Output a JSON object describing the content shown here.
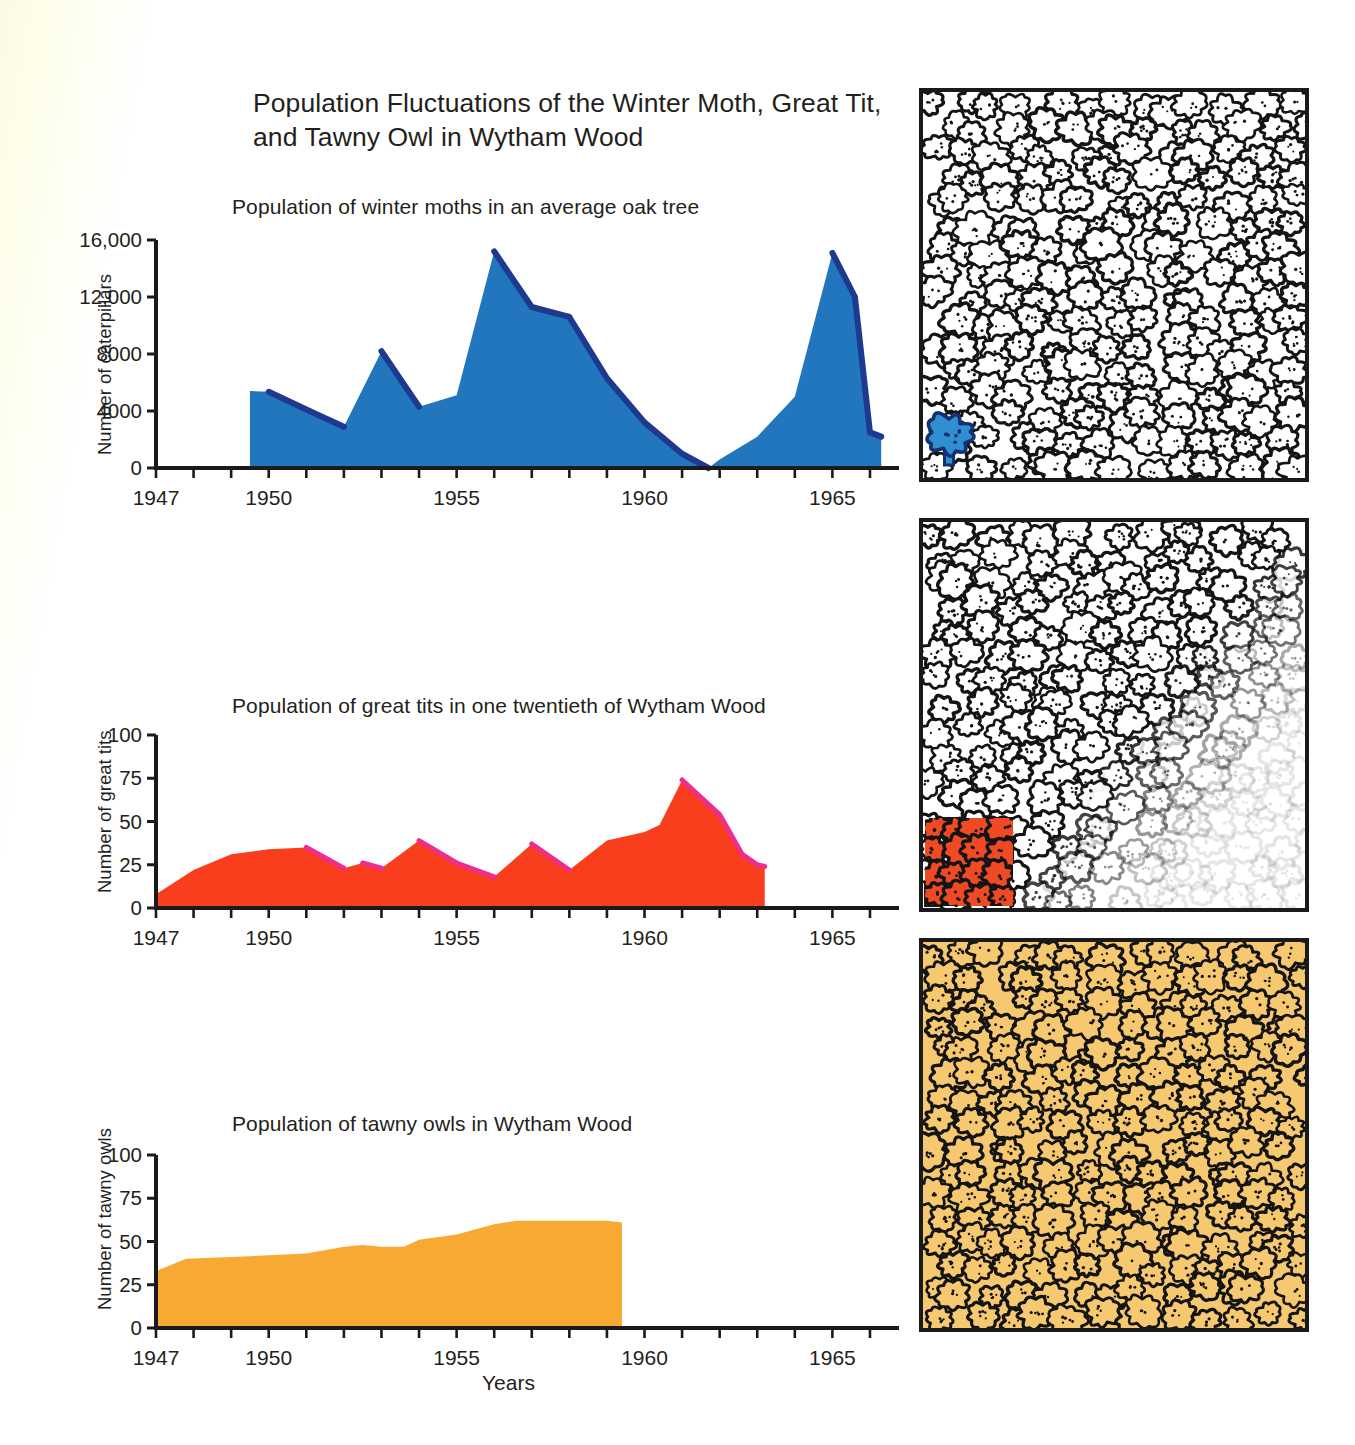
{
  "figure": {
    "title": "Population Fluctuations of the Winter Moth, Great Tit,\nand Tawny Owl in Wytham Wood",
    "title_line1": "Population Fluctuations of the Winter Moth, Great Tit,",
    "title_line2": "and Tawny Owl in Wytham Wood",
    "x_axis_label": "Years",
    "background_color": "#ffffff"
  },
  "colors": {
    "moth_fill": "#2176bd",
    "moth_edge": "#1d3a8f",
    "tit_fill": "#f93e1d",
    "tit_edge": "#ee2d8e",
    "owl_fill": "#f7a933",
    "panel_tint_owl": "#f6c870",
    "panel_tint_tit": "#f04a25",
    "panel_tree_blue": "#2f8fd0",
    "axis": "#1a1a1a",
    "text": "#231f20"
  },
  "panels": [
    {
      "name": "forest-single-oak",
      "description": "Forest of outlined oak trees with one highlighted blue tree in the lower-left corner",
      "highlight": "single-blue-tree"
    },
    {
      "name": "forest-one-twentieth",
      "description": "Forest of outlined oak trees with a red square covering one twentieth of the wood at the lower left",
      "highlight": "red-square-region"
    },
    {
      "name": "forest-whole-wood",
      "description": "Entire forest tinted orange representing the whole of Wytham Wood",
      "highlight": "whole-wood-orange"
    }
  ],
  "chart_data": [
    {
      "type": "area",
      "name": "winter-moths",
      "title": "Population of winter moths in an average oak tree",
      "xlabel": "",
      "ylabel": "Number of caterpillars",
      "xlim": [
        1947,
        1966.4
      ],
      "ylim": [
        0,
        16000
      ],
      "ytick_labels": [
        "0",
        "4000",
        "8000",
        "12,000",
        "16,000"
      ],
      "yticks": [
        0,
        4000,
        8000,
        12000,
        16000
      ],
      "xtick_labels": [
        "1947",
        "1950",
        "1955",
        "1960",
        "1965"
      ],
      "xticks_labeled": [
        1947,
        1950,
        1955,
        1960,
        1965
      ],
      "xticks_minor_step": 1,
      "grid": false,
      "legend": "none",
      "fill_color": "#2176bd",
      "edge_color": "#1d3a8f",
      "x": [
        1949.5,
        1950,
        1951,
        1952,
        1953,
        1954,
        1955,
        1956,
        1957,
        1958,
        1959,
        1960,
        1961,
        1961.7,
        1962,
        1963,
        1964,
        1965,
        1965.6,
        1966,
        1966.3
      ],
      "values": [
        5400,
        5350,
        4100,
        2900,
        8200,
        4300,
        5100,
        15200,
        11300,
        10600,
        6300,
        3200,
        1000,
        0,
        600,
        2200,
        5000,
        15100,
        12000,
        2500,
        2200
      ]
    },
    {
      "type": "area",
      "name": "great-tits",
      "title": "Population of great tits in one twentieth of Wytham Wood",
      "xlabel": "",
      "ylabel": "Number of great tits",
      "xlim": [
        1947,
        1966.4
      ],
      "ylim": [
        0,
        100
      ],
      "ytick_labels": [
        "0",
        "25",
        "50",
        "75",
        "100"
      ],
      "yticks": [
        0,
        25,
        50,
        75,
        100
      ],
      "xtick_labels": [
        "1947",
        "1950",
        "1955",
        "1960",
        "1965"
      ],
      "xticks_labeled": [
        1947,
        1950,
        1955,
        1960,
        1965
      ],
      "xticks_minor_step": 1,
      "grid": false,
      "legend": "none",
      "fill_color": "#f93e1d",
      "edge_color": "#ee2d8e",
      "x": [
        1947,
        1948,
        1949,
        1950,
        1951,
        1952,
        1952.5,
        1953,
        1954,
        1955,
        1956,
        1957,
        1958,
        1959,
        1960,
        1960.4,
        1961,
        1962,
        1962.6,
        1963,
        1963.2
      ],
      "values": [
        8,
        22,
        31,
        34,
        35,
        23,
        26,
        23,
        39,
        26,
        18,
        37,
        22,
        39,
        44,
        48,
        74,
        54,
        31,
        25,
        24
      ]
    },
    {
      "type": "area",
      "name": "tawny-owls",
      "title": "Population of tawny owls in Wytham Wood",
      "xlabel": "Years",
      "ylabel": "Number of tawny owls",
      "xlim": [
        1947,
        1966.4
      ],
      "ylim": [
        0,
        100
      ],
      "ytick_labels": [
        "0",
        "25",
        "50",
        "75",
        "100"
      ],
      "yticks": [
        0,
        25,
        50,
        75,
        100
      ],
      "xtick_labels": [
        "1947",
        "1950",
        "1955",
        "1960",
        "1965"
      ],
      "xticks_labeled": [
        1947,
        1950,
        1955,
        1960,
        1965
      ],
      "xticks_minor_step": 1,
      "grid": false,
      "legend": "none",
      "fill_color": "#f7a933",
      "edge_color": "#f7a933",
      "x": [
        1947,
        1947.8,
        1949,
        1950,
        1951,
        1952,
        1952.5,
        1953,
        1953.6,
        1954,
        1955,
        1956,
        1956.6,
        1957,
        1958,
        1959,
        1959.4
      ],
      "values": [
        33,
        40,
        41,
        42,
        43,
        47,
        48,
        47,
        47,
        51,
        54,
        60,
        62,
        62,
        62,
        62,
        61
      ]
    }
  ]
}
